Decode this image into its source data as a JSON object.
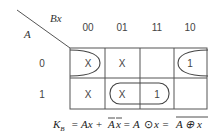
{
  "kmap": {
    "row_variable": "A",
    "col_variable": "Bx",
    "col_headers": [
      "00",
      "01",
      "11",
      "10"
    ],
    "row_headers": [
      "0",
      "1"
    ],
    "cells": [
      [
        "X",
        "X",
        "",
        "1"
      ],
      [
        "X",
        "X",
        "1",
        ""
      ]
    ],
    "groups": [
      {
        "name": "wrap-group-row0",
        "cells": [
          [
            0,
            0
          ],
          [
            0,
            3
          ]
        ]
      },
      {
        "name": "group-row1-01-11",
        "cells": [
          [
            1,
            1
          ],
          [
            1,
            2
          ]
        ]
      }
    ]
  },
  "equation": {
    "lhs": "K",
    "lhs_sub": "B",
    "eq1": "= Ax +",
    "term2_a": "A",
    "term2_x": "x",
    "eq2": "= A",
    "odot": "⊙",
    "eq2b": "x =",
    "xor_expr": "A ⊕ x"
  }
}
